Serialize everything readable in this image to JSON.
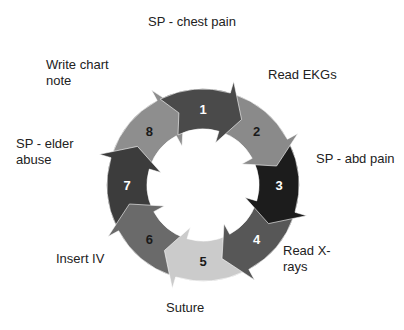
{
  "diagram": {
    "type": "circular-cycle",
    "center": [
      203,
      185
    ],
    "outer_radius": 96,
    "inner_radius": 56,
    "steps": [
      {
        "number": "1",
        "label": "SP - chest pain",
        "fill": "#4a4a4a",
        "num_color": "#ffffff"
      },
      {
        "number": "2",
        "label": "Read EKGs",
        "fill": "#8a8a8a",
        "num_color": "#1a1a1a"
      },
      {
        "number": "3",
        "label": "SP - abd pain",
        "fill": "#1c1c1c",
        "num_color": "#ffffff"
      },
      {
        "number": "4",
        "label": "Read X-rays",
        "fill": "#575757",
        "num_color": "#ffffff"
      },
      {
        "number": "5",
        "label": "Suture",
        "fill": "#cbcbcb",
        "num_color": "#1a1a1a"
      },
      {
        "number": "6",
        "label": "Insert IV",
        "fill": "#6a6a6a",
        "num_color": "#1a1a1a"
      },
      {
        "number": "7",
        "label": "SP - elder abuse",
        "fill": "#3c3c3c",
        "num_color": "#ffffff"
      },
      {
        "number": "8",
        "label": "Write chart note",
        "fill": "#8e8e8e",
        "num_color": "#1a1a1a"
      }
    ]
  },
  "labels": {
    "l1": "SP - chest pain",
    "l2": "Read EKGs",
    "l3": "SP - abd pain",
    "l4a": "Read X-",
    "l4b": "rays",
    "l5": "Suture",
    "l6": "Insert IV",
    "l7a": "SP - elder",
    "l7b": "abuse",
    "l8a": "Write chart",
    "l8b": "note"
  }
}
